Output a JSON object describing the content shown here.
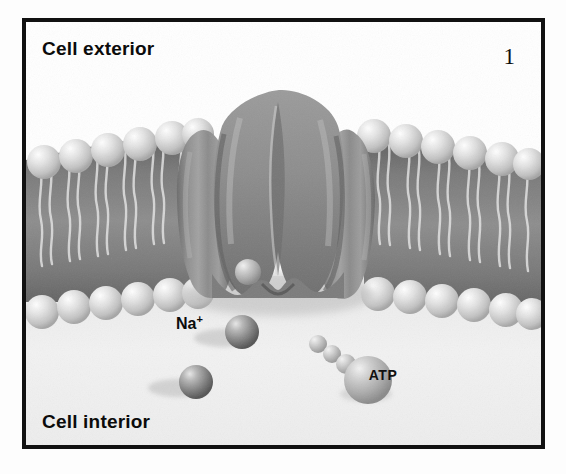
{
  "figure": {
    "panel_number": "1",
    "title_exterior": "Cell exterior",
    "title_interior": "Cell interior",
    "background_color": "#ffffff",
    "frame_color": "#111111",
    "interior_fill": "#efefef"
  },
  "labels": {
    "exterior": "Cell exterior",
    "interior": "Cell interior",
    "sodium_ion": "Na",
    "sodium_charge": "+",
    "atp": "ATP"
  },
  "membrane": {
    "description": "phospholipid bilayer",
    "head_color": "#d9d9d9",
    "tail_color": "#c9c9c9",
    "core_color": "#6f6f6f",
    "outer_head_count_left": 7,
    "outer_head_count_right": 7,
    "inner_head_count_left": 7,
    "inner_head_count_right": 7
  },
  "protein": {
    "name": "sodium-potassium pump protein",
    "fill_color": "#8a8a8a",
    "shadow_color": "#5d5d5d",
    "highlight_color": "#a8a8a8",
    "lobes": 3,
    "has_central_channel": true
  },
  "molecules": {
    "sodium_ions": [
      {
        "name": "sodium-ion-bound",
        "cx": 243,
        "cy": 272,
        "r": 12,
        "color": "#9a9a9a"
      },
      {
        "name": "sodium-ion-upper",
        "cx": 233,
        "cy": 331,
        "r": 16,
        "color": "#7e7e7e"
      },
      {
        "name": "sodium-ion-lower",
        "cx": 188,
        "cy": 381,
        "r": 16,
        "color": "#7e7e7e"
      }
    ],
    "atp": {
      "name": "atp-molecule",
      "label": "ATP",
      "body": {
        "cx": 357,
        "cy": 368,
        "r": 23,
        "color": "#b0b0b0"
      },
      "phosphates": [
        {
          "cx": 315,
          "cy": 340,
          "r": 8
        },
        {
          "cx": 329,
          "cy": 349,
          "r": 8
        },
        {
          "cx": 343,
          "cy": 358,
          "r": 9
        }
      ]
    }
  }
}
